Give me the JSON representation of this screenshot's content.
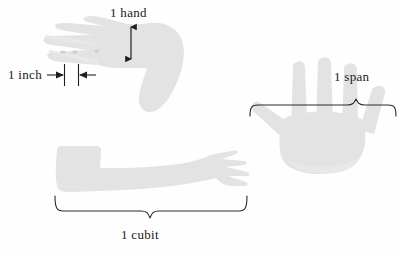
{
  "figure": {
    "background_color": "#fefefe",
    "silhouette_color": "#e3e3e3",
    "ink_color": "#1f1f1f",
    "width": 401,
    "height": 257
  },
  "labels": {
    "hand": "1  hand",
    "inch": "1  inch",
    "span": "1  span",
    "cubit": "1  cubit"
  },
  "annotations": [
    {
      "id": "hand",
      "label": "1  hand",
      "marker": "double-headed-vertical-arrow",
      "unit": "hand",
      "measures": "width across the palm of a closed hand",
      "orientation": "vertical",
      "x": 131,
      "y_top": 24,
      "y_bottom": 62,
      "length_px": 38
    },
    {
      "id": "inch",
      "label": "1  inch",
      "marker": "inward-arrows-between-tick-lines",
      "unit": "inch",
      "measures": "width of a thumb joint",
      "orientation": "horizontal",
      "tick_left_x": 64,
      "tick_right_x": 78,
      "y": 74,
      "length_px": 14
    },
    {
      "id": "span",
      "label": "1  span",
      "marker": "curly-brace-up",
      "unit": "span",
      "measures": "distance from thumb tip to little-finger tip of a spread hand",
      "orientation": "horizontal",
      "x_start": 250,
      "x_end": 396,
      "y": 104,
      "peak_x": 355,
      "length_px": 146
    },
    {
      "id": "cubit",
      "label": "1  cubit",
      "marker": "curly-brace-down",
      "unit": "cubit",
      "measures": "distance from elbow to fingertips",
      "orientation": "horizontal",
      "x_start": 55,
      "x_end": 247,
      "y": 197,
      "peak_x": 150,
      "length_px": 192
    }
  ],
  "shapes": [
    {
      "id": "profile-hand",
      "name": "hand-in-profile-silhouette",
      "description": "Left hand seen edge-on, fingers extended toward the left, wrist and forearm stub to the lower right",
      "bbox": [
        44,
        22,
        185,
        112
      ]
    },
    {
      "id": "spread-hand",
      "name": "open-spread-hand-silhouette",
      "description": "Right hand palm-forward with fingers and thumb spread wide apart",
      "bbox": [
        250,
        58,
        398,
        160
      ]
    },
    {
      "id": "forearm",
      "name": "forearm-and-hand-silhouette",
      "description": "Forearm from elbow at left to fingertips at right",
      "bbox": [
        55,
        145,
        248,
        194
      ]
    }
  ]
}
